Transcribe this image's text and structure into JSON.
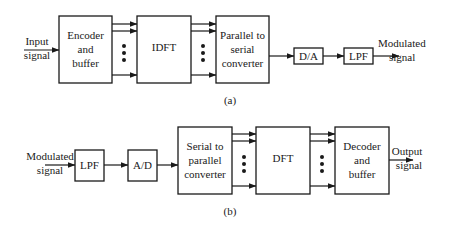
{
  "diagram_a": {
    "input_label": [
      "Input",
      "signal"
    ],
    "blocks": [
      {
        "id": "encoder",
        "lines": [
          "Encoder",
          "and",
          "buffer"
        ]
      },
      {
        "id": "idft",
        "lines": [
          "IDFT"
        ]
      },
      {
        "id": "p2s",
        "lines": [
          "Parallel to",
          "serial",
          "converter"
        ]
      },
      {
        "id": "da",
        "lines": [
          "D/A"
        ]
      },
      {
        "id": "lpf",
        "lines": [
          "LPF"
        ]
      }
    ],
    "output_label": [
      "Modulated",
      "signal"
    ],
    "caption": "(a)"
  },
  "diagram_b": {
    "input_label": [
      "Modulated",
      "signal"
    ],
    "blocks": [
      {
        "id": "lpf",
        "lines": [
          "LPF"
        ]
      },
      {
        "id": "ad",
        "lines": [
          "A/D"
        ]
      },
      {
        "id": "s2p",
        "lines": [
          "Serial to",
          "parallel",
          "converter"
        ]
      },
      {
        "id": "dft",
        "lines": [
          "DFT"
        ]
      },
      {
        "id": "decoder",
        "lines": [
          "Decoder",
          "and",
          "buffer"
        ]
      }
    ],
    "output_label": [
      "Output",
      "signal"
    ],
    "caption": "(b)"
  }
}
